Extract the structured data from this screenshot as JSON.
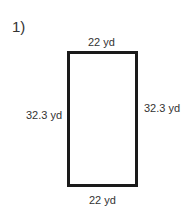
{
  "problem": {
    "number": "1)",
    "shape": "rectangle",
    "labels": {
      "top": "22 yd",
      "bottom": "22 yd",
      "left": "32.3 yd",
      "right": "32.3 yd"
    }
  },
  "colors": {
    "stroke": "#1a1a1a",
    "text": "#333333",
    "background": "#ffffff"
  }
}
